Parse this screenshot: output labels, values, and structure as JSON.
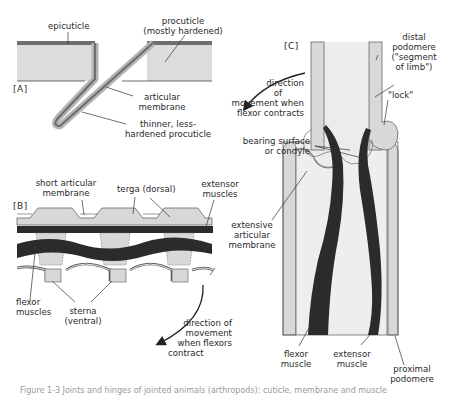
{
  "figure": {
    "caption": "Figure 1-3  Joints and hinges of jointed animals (arthropods): cuticle, membrane and muscle"
  },
  "panel_a": {
    "tag": "[A]",
    "labels": {
      "epicuticle": "epicuticle",
      "procuticle_1": "procuticle",
      "procuticle_2": "(mostly hardened)",
      "articular_1": "articular",
      "articular_2": "membrane",
      "thinner_1": "thinner, less-",
      "thinner_2": "hardened procuticle"
    }
  },
  "panel_b": {
    "tag": "[B]",
    "labels": {
      "short_1": "short articular",
      "short_2": "membrane",
      "terga": "terga (dorsal)",
      "extensor_1": "extensor",
      "extensor_2": "muscles",
      "flexor_1": "flexor",
      "flexor_2": "muscles",
      "sterna_1": "sterna",
      "sterna_2": "(ventral)",
      "dir_1": "direction of",
      "dir_2": "movement",
      "dir_3": "when flexors",
      "dir_4": "contract"
    }
  },
  "panel_c": {
    "tag": "[C]",
    "labels": {
      "distal_1": "distal",
      "distal_2": "podomere",
      "distal_3": "(\"segment",
      "distal_4": "of limb\")",
      "lock": "\"lock\"",
      "dir_1": "direction",
      "dir_2": "of",
      "dir_3": "movement when",
      "dir_4": "flexor contracts",
      "bearing_1": "bearing surface",
      "bearing_2": "or condyle",
      "extensive_1": "extensive",
      "extensive_2": "articular",
      "extensive_3": "membrane",
      "flexor_1": "flexor",
      "flexor_2": "muscle",
      "extensor_1": "extensor",
      "extensor_2": "muscle",
      "proximal_1": "proximal",
      "proximal_2": "podomere"
    }
  },
  "colors": {
    "cuticle_fill": "#d9d9d9",
    "epicuticle": "#7a7a7a",
    "muscle": "#2b2b2b",
    "line": "#333333",
    "membrane": "#bdbdbd"
  }
}
